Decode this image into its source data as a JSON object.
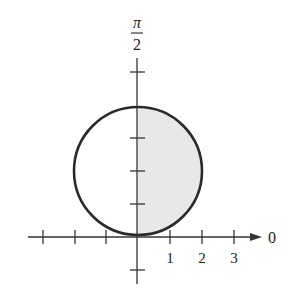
{
  "diagram": {
    "type": "polar-graph",
    "polar_axis_label": "0",
    "vertical_axis_label_numerator": "π",
    "vertical_axis_label_denominator": "2",
    "tick_labels": [
      "1",
      "2",
      "3"
    ],
    "curve": {
      "shape": "circle",
      "center": [
        0,
        1
      ],
      "radius": 1,
      "scale_units_px": 32
    },
    "colors": {
      "stroke": "#2a2a2a",
      "shade": "#e6e6e6",
      "axis": "#333333"
    }
  }
}
